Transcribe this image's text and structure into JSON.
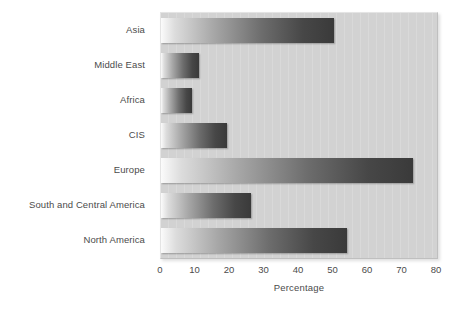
{
  "chart_data": {
    "type": "bar",
    "orientation": "horizontal",
    "title": "",
    "subtitle": "",
    "xlabel": "Percentage",
    "ylabel": "",
    "categories": [
      "Asia",
      "Middle East",
      "Africa",
      "CIS",
      "Europe",
      "South and Central America",
      "North America"
    ],
    "values": [
      50,
      11,
      9,
      19,
      73,
      26,
      54
    ],
    "series": [
      {
        "name": "Percentage",
        "values": [
          50,
          11,
          9,
          19,
          73,
          26,
          54
        ]
      }
    ],
    "xlim": [
      0,
      80
    ],
    "xticks": [
      0,
      10,
      20,
      30,
      40,
      50,
      60,
      70,
      80
    ],
    "xtick_labels": [
      "0",
      "10",
      "20",
      "30",
      "40",
      "50",
      "60",
      "70",
      "80"
    ],
    "grid": false,
    "legend": null,
    "legend_position": "none",
    "annotations": []
  },
  "style": {
    "plot_background": "#d2d2d2",
    "page_background": "#ffffff",
    "bar_gradient_start": "#fbfbfb",
    "bar_gradient_end": "#3a3a3a",
    "text_color": "#4b4b4b"
  }
}
